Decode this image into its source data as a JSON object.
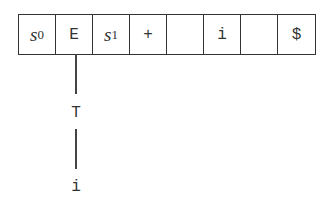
{
  "stack_cells": [
    {
      "type": "state",
      "symbol": "s",
      "subscript": "0"
    },
    {
      "type": "symbol",
      "text": "E"
    },
    {
      "type": "state",
      "symbol": "s",
      "subscript": "1"
    },
    {
      "type": "symbol",
      "text": "+"
    },
    {
      "type": "symbol",
      "text": ""
    },
    {
      "type": "symbol",
      "text": "i"
    },
    {
      "type": "symbol",
      "text": ""
    },
    {
      "type": "symbol",
      "text": "$"
    }
  ],
  "tree": {
    "root": "E",
    "child": "T",
    "grandchild": "i"
  }
}
